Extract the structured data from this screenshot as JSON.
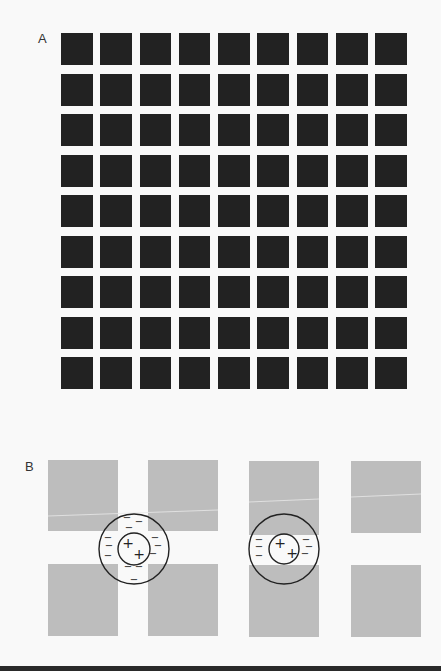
{
  "panels": {
    "a": {
      "label": "A",
      "grid": {
        "rows": 9,
        "columns": 9,
        "square_color": "#222222",
        "background_color": "#f9f9f9"
      }
    },
    "b": {
      "label": "B",
      "square_color": "#bdbdbd",
      "squares": [
        {
          "x": 48,
          "y": 460,
          "w": 70,
          "h": 71
        },
        {
          "x": 148,
          "y": 460,
          "w": 70,
          "h": 71
        },
        {
          "x": 48,
          "y": 564,
          "w": 70,
          "h": 72
        },
        {
          "x": 148,
          "y": 564,
          "w": 70,
          "h": 72
        },
        {
          "x": 249,
          "y": 461,
          "w": 70,
          "h": 74
        },
        {
          "x": 249,
          "y": 565,
          "w": 70,
          "h": 72
        },
        {
          "x": 351,
          "y": 461,
          "w": 70,
          "h": 72
        },
        {
          "x": 351,
          "y": 565,
          "w": 70,
          "h": 72
        }
      ],
      "receptive_fields": [
        {
          "name": "intersection-field",
          "cx": 134,
          "cy": 549,
          "outer_r": 35,
          "inner_r": 16,
          "center_signs": [
            {
              "sym": "+",
              "x": 128,
              "y": 543
            },
            {
              "sym": "+",
              "x": 139,
              "y": 554
            }
          ],
          "surround_signs": [
            {
              "sym": "−",
              "x": 127,
              "y": 517
            },
            {
              "sym": "−",
              "x": 139,
              "y": 521
            },
            {
              "sym": "−",
              "x": 129,
              "y": 527
            },
            {
              "sym": "−",
              "x": 108,
              "y": 537
            },
            {
              "sym": "−",
              "x": 109,
              "y": 545
            },
            {
              "sym": "−",
              "x": 108,
              "y": 555
            },
            {
              "sym": "−",
              "x": 155,
              "y": 537
            },
            {
              "sym": "−",
              "x": 158,
              "y": 545
            },
            {
              "sym": "−",
              "x": 153,
              "y": 553
            },
            {
              "sym": "−",
              "x": 128,
              "y": 566
            },
            {
              "sym": "−",
              "x": 139,
              "y": 566
            },
            {
              "sym": "−",
              "x": 134,
              "y": 579
            }
          ]
        },
        {
          "name": "street-field",
          "cx": 284,
          "cy": 549,
          "outer_r": 35,
          "inner_r": 15,
          "center_signs": [
            {
              "sym": "+",
              "x": 280,
              "y": 543
            },
            {
              "sym": "+",
              "x": 292,
              "y": 553
            }
          ],
          "surround_signs": [
            {
              "sym": "−",
              "x": 259,
              "y": 539
            },
            {
              "sym": "−",
              "x": 259,
              "y": 546
            },
            {
              "sym": "−",
              "x": 259,
              "y": 555
            },
            {
              "sym": "−",
              "x": 306,
              "y": 539
            },
            {
              "sym": "−",
              "x": 309,
              "y": 546
            },
            {
              "sym": "−",
              "x": 305,
              "y": 553
            }
          ]
        }
      ]
    }
  }
}
